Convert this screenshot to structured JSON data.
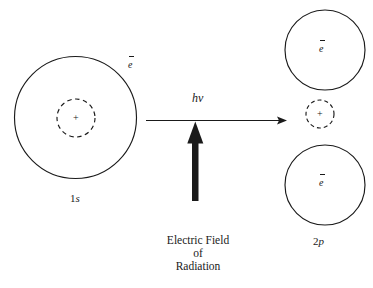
{
  "figure": {
    "type": "atomic-orbital-photoexcitation-diagram",
    "background_color": "#ffffff",
    "ink_color": "#1a1a1a",
    "left_atom": {
      "orbital_label": "1s",
      "orbital_label_digit": "1",
      "orbital_label_letter": "s",
      "electron_label": "e",
      "electron_charge_mark": "–",
      "nucleus_symbol": "+",
      "shell_shape": "solid-circle",
      "nucleus_shape": "dashed-circle"
    },
    "transition": {
      "photon_label_h": "h",
      "photon_label_nu": "ν",
      "arrow_direction": "right"
    },
    "field": {
      "arrow_direction": "up",
      "caption_line1": "Electric Field",
      "caption_line2": "of",
      "caption_line3": "Radiation"
    },
    "right_atom": {
      "orbital_label": "2p",
      "orbital_label_digit": "2",
      "orbital_label_letter": "p",
      "electron_label_top": "e",
      "electron_label_bottom": "e",
      "electron_charge_mark": "–",
      "nucleus_symbol": "+",
      "lobe_shape": "solid-circle",
      "nucleus_shape": "dashed-circle"
    }
  }
}
